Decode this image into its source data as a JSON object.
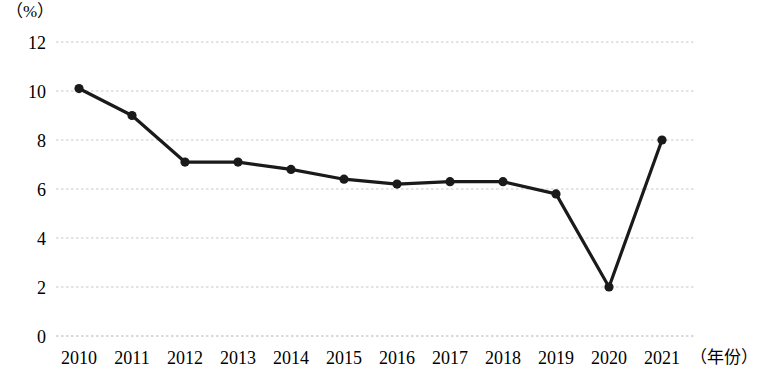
{
  "chart_data": {
    "type": "line",
    "title": "",
    "subtitle": "",
    "xlabel": "（年份）",
    "ylabel": "（%）",
    "categories": [
      "2010",
      "2011",
      "2012",
      "2013",
      "2014",
      "2015",
      "2016",
      "2017",
      "2018",
      "2019",
      "2020",
      "2021"
    ],
    "values": [
      10.1,
      9.0,
      7.1,
      7.1,
      6.8,
      6.4,
      6.2,
      6.3,
      6.3,
      5.8,
      2.0,
      8.0
    ],
    "series": [
      {
        "name": "",
        "values": [
          10.1,
          9.0,
          7.1,
          7.1,
          6.8,
          6.4,
          6.2,
          6.3,
          6.3,
          5.8,
          2.0,
          8.0
        ]
      }
    ],
    "ylim": [
      0,
      12
    ],
    "yticks": [
      "0",
      "2",
      "4",
      "6",
      "8",
      "10",
      "12"
    ],
    "ytick_values": [
      0,
      2,
      4,
      6,
      8,
      10,
      12
    ],
    "xticks": [
      "2010",
      "2011",
      "2012",
      "2013",
      "2014",
      "2015",
      "2016",
      "2017",
      "2018",
      "2019",
      "2020",
      "2021"
    ],
    "grid": "horizontal-dotted",
    "legend": "none",
    "line_color": "#1a1a1a",
    "marker_color": "#1a1a1a",
    "grid_color": "#c8c8c8",
    "background_color": "#ffffff",
    "annotations": []
  }
}
